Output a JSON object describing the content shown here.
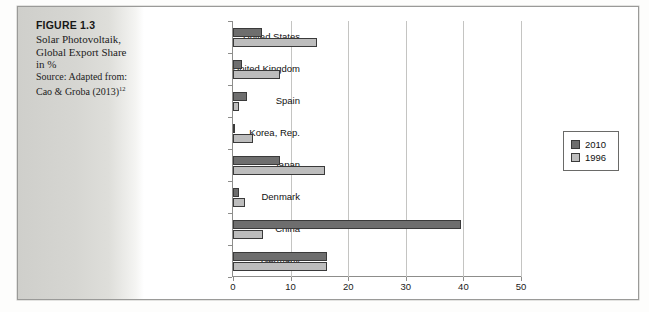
{
  "figure": {
    "number_label": "FIGURE 1.3",
    "title_line_1": "Solar Photovoltaik,",
    "title_line_2": "Global Export Share",
    "title_line_3": "in %",
    "source_line_1": "Source: Adapted from:",
    "source_line_2": "Cao & Groba (2013)",
    "source_footnote": "12"
  },
  "legend": {
    "position": "right",
    "items": [
      {
        "label": "2010",
        "color": "#6e6e6e"
      },
      {
        "label": "1996",
        "color": "#bdbdbd"
      }
    ]
  },
  "axis": {
    "x_ticks": [
      "0",
      "10",
      "20",
      "30",
      "40",
      "50"
    ]
  },
  "chart_data": {
    "type": "bar",
    "orientation": "horizontal",
    "title": "Solar Photovoltaik, Global Export Share in %",
    "xlabel": "",
    "ylabel": "",
    "xlim": [
      0,
      50
    ],
    "xticks": [
      0,
      10,
      20,
      30,
      40,
      50
    ],
    "grid": true,
    "legend_position": "right",
    "categories": [
      "United States",
      "United Kingdom",
      "Spain",
      "Korea, Rep.",
      "Japan",
      "Denmark",
      "China",
      "Germany"
    ],
    "series": [
      {
        "name": "2010",
        "color": "#6e6e6e",
        "values": [
          5.0,
          1.6,
          2.4,
          0.2,
          8.1,
          1.0,
          39.5,
          16.3
        ]
      },
      {
        "name": "1996",
        "color": "#bdbdbd",
        "values": [
          14.6,
          8.1,
          1.0,
          3.5,
          16.0,
          2.1,
          5.2,
          16.3
        ]
      }
    ]
  }
}
